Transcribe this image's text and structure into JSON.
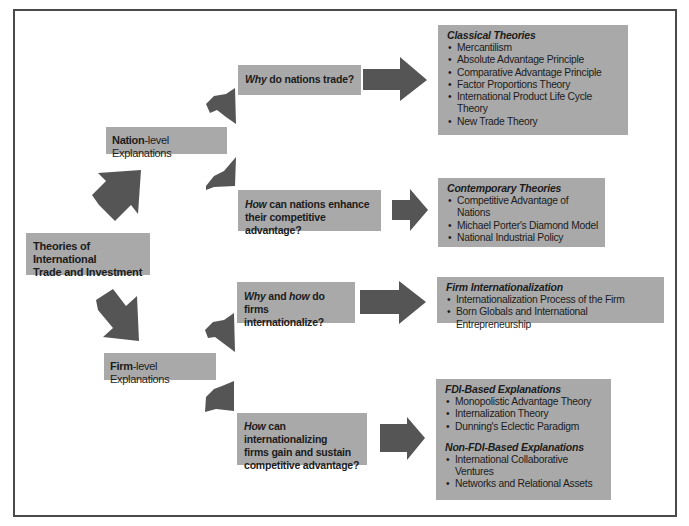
{
  "diagram": {
    "root": {
      "line1": "Theories of International",
      "line2": "Trade and Investment"
    },
    "nation_level": {
      "bold": "Nation",
      "rest": "-level Explanations"
    },
    "firm_level": {
      "bold": "Firm",
      "rest": "-level Explanations"
    },
    "questions": [
      {
        "italic": "Why",
        "rest": " do nations trade?",
        "line2": ""
      },
      {
        "italic": "How",
        "rest": " can nations enhance",
        "line2": "their competitive advantage?"
      },
      {
        "italic": "Why",
        "mid": " and ",
        "italic2": "how",
        "rest": " do firms",
        "line2": "internationalize?"
      },
      {
        "italic": "How",
        "rest": " can internationalizing",
        "line2": "firms gain and sustain",
        "line3": "competitive advantage?"
      }
    ],
    "theory_boxes": [
      {
        "heading": "Classical Theories",
        "items": [
          "Mercantilism",
          "Absolute Advantage Principle",
          "Comparative Advantage Principle",
          "Factor Proportions Theory",
          "International Product Life Cycle Theory",
          "New Trade Theory"
        ]
      },
      {
        "heading": "Contemporary Theories",
        "items": [
          "Competitive Advantage of Nations",
          "Michael Porter's Diamond Model",
          "National Industrial Policy"
        ]
      },
      {
        "heading": "Firm Internationalization",
        "items": [
          "Internationalization Process of the Firm",
          "Born Globals and International Entrepreneurship"
        ]
      },
      {
        "heading": "FDI-Based Explanations",
        "items": [
          "Monopolistic Advantage Theory",
          "Internalization Theory",
          "Dunning's Eclectic Paradigm"
        ],
        "heading2": "Non-FDI-Based Explanations",
        "items2": [
          "International Collaborative Ventures",
          "Networks and Relational Assets"
        ]
      }
    ],
    "colors": {
      "box_fill": "#a9a9a9",
      "arrow_fill": "#555555",
      "frame": "#4a4a4a",
      "background": "#ffffff"
    }
  }
}
